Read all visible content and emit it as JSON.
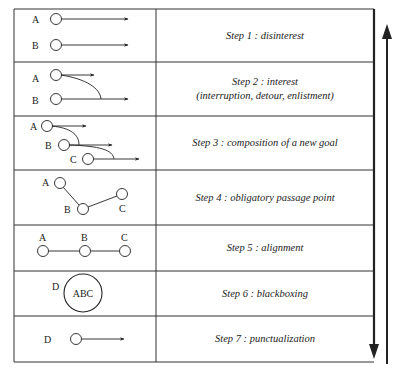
{
  "figure": {
    "steps": [
      {
        "label": "Step 1 : disinterest",
        "sublabel": "",
        "nodes": [
          "A",
          "B"
        ]
      },
      {
        "label": "Step 2 : interest",
        "sublabel": "(interruption, detour, enlistment)",
        "nodes": [
          "A",
          "B"
        ]
      },
      {
        "label": "Step 3 : composition of a new goal",
        "sublabel": "",
        "nodes": [
          "A",
          "B",
          "C"
        ]
      },
      {
        "label": "Step 4 : obligatory passage point",
        "sublabel": "",
        "nodes": [
          "A",
          "B",
          "C"
        ]
      },
      {
        "label": "Step 5 : alignment",
        "sublabel": "",
        "nodes": [
          "A",
          "B",
          "C"
        ]
      },
      {
        "label": "Step 6 : blackboxing",
        "sublabel": "",
        "nodes": [
          "D"
        ],
        "box_label": "ABC"
      },
      {
        "label": "Step 7 : punctualization",
        "sublabel": "",
        "nodes": [
          "D"
        ]
      }
    ],
    "arrows": {
      "down_arrow": "progression-down-arrow",
      "up_arrow": "reversal-up-arrow"
    },
    "colors": {
      "line": "#222222",
      "background": "#ffffff"
    }
  }
}
